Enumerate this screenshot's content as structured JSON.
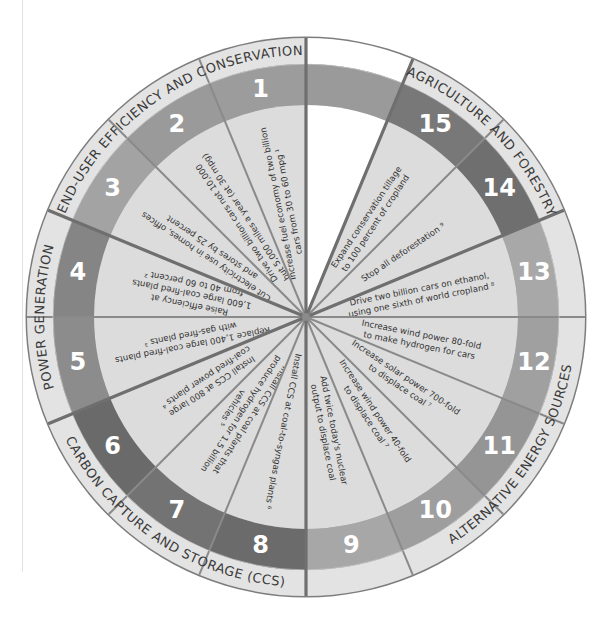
{
  "diagram": {
    "type": "stabilization-wedge-wheel",
    "center": [
      306,
      317
    ],
    "radii": {
      "outer": 279,
      "category_inner": 253,
      "number_inner": 212
    },
    "colors": {
      "outline": "#7d7d7d",
      "wedge_fill": "#dcdcdc",
      "category_band": "#e3e3e3",
      "empty_wedge": "#ffffff",
      "empty_number_band": "#9a9a9a",
      "number_text": "#ffffff",
      "label_text": "#333333"
    },
    "categories": [
      {
        "id": "end-user",
        "label": "END-USER EFFICIENCY AND CONSERVATION",
        "wedges": [
          1,
          2,
          3
        ],
        "band_color": "#9a9a9a"
      },
      {
        "id": "power",
        "label": "POWER GENERATION",
        "wedges": [
          4,
          5
        ],
        "band_color": "#858585"
      },
      {
        "id": "ccs",
        "label": "CARBON CAPTURE AND STORAGE (CCS)",
        "wedges": [
          6,
          7,
          8
        ],
        "band_color": "#6e6e6e"
      },
      {
        "id": "alternative",
        "label": "ALTERNATIVE ENERGY SOURCES",
        "wedges": [
          9,
          10,
          11,
          12,
          13
        ],
        "band_color": "#a0a0a0"
      },
      {
        "id": "agriculture",
        "label": "AGRICULTURE AND FORESTRY",
        "wedges": [
          14,
          15
        ],
        "band_color": "#767676"
      }
    ],
    "wedges": [
      {
        "number": "1",
        "lines": [
          "Increase fuel economy of two billion",
          "cars from 30 to 60 mpg ¹"
        ],
        "band_color": "#9c9c9c"
      },
      {
        "number": "2",
        "lines": [
          "Drive two billion cars not 10,000",
          "but 5,000 miles a year (at 30 mpg)"
        ],
        "band_color": "#9a9a9a"
      },
      {
        "number": "3",
        "lines": [
          "Cut electricity use in homes, offices",
          "and stores by 25 percent"
        ],
        "band_color": "#a3a3a3"
      },
      {
        "number": "4",
        "lines": [
          "Raise efficiency at",
          "1,600 large coal-fired plants",
          "from 40 to 60 percent ²"
        ],
        "band_color": "#858585"
      },
      {
        "number": "5",
        "lines": [
          "Replace 1,400 large coal-fired plants",
          "with gas-fired plants ³"
        ],
        "band_color": "#8c8c8c"
      },
      {
        "number": "6",
        "lines": [
          "Install CCS at 800 large",
          "coal-fired power plants ⁴"
        ],
        "band_color": "#6a6a6a"
      },
      {
        "number": "7",
        "lines": [
          "Install CCS at coal plants that",
          "produce hydrogen for 1.5 billion",
          "vehicles ⁵"
        ],
        "band_color": "#737373"
      },
      {
        "number": "8",
        "lines": [
          "Install CCS at coal-to-syngas plants ⁶"
        ],
        "band_color": "#6b6b6b"
      },
      {
        "number": "9",
        "lines": [
          "Add twice today's nuclear",
          "output to displace coal"
        ],
        "band_color": "#a7a7a7"
      },
      {
        "number": "10",
        "lines": [
          "Increase wind power 40-fold",
          "to displace coal ⁷"
        ],
        "band_color": "#9e9e9e"
      },
      {
        "number": "11",
        "lines": [
          "Increase solar power 700-fold",
          "to displace coal ⁷"
        ],
        "band_color": "#959595"
      },
      {
        "number": "12",
        "lines": [
          "Increase wind power 80-fold",
          "to make hydrogen for cars"
        ],
        "band_color": "#a0a0a0"
      },
      {
        "number": "13",
        "lines": [
          "Drive two billion cars on ethanol,",
          "using one sixth of world cropland ⁸"
        ],
        "band_color": "#a8a8a8"
      },
      {
        "number": "14",
        "lines": [
          "Stop all deforestation ⁹"
        ],
        "band_color": "#6f6f6f"
      },
      {
        "number": "15",
        "lines": [
          "Expand conservation tillage",
          "to 100 percent of cropland"
        ],
        "band_color": "#787878"
      }
    ]
  }
}
